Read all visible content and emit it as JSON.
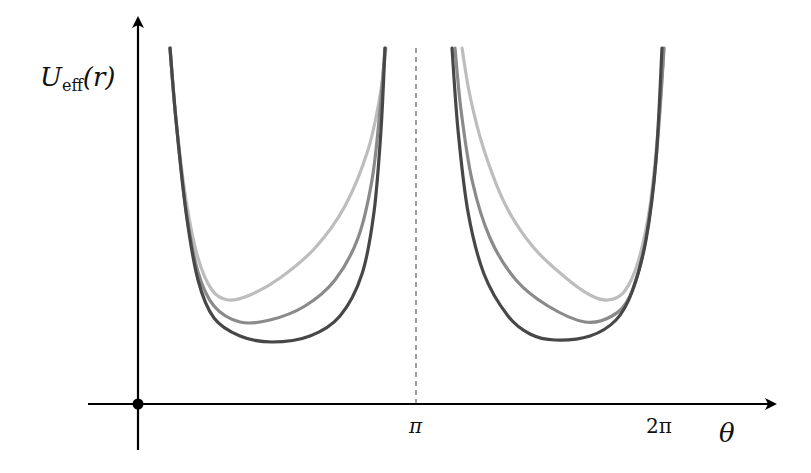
{
  "chart_data": {
    "type": "line",
    "title": "",
    "xlabel": "θ",
    "ylabel_main": "U",
    "ylabel_sub": "eff",
    "ylabel_arg": "(r)",
    "x_ticks": [
      {
        "label": "π",
        "value": 3.14159
      },
      {
        "label": "2π",
        "value": 6.28318
      }
    ],
    "xlim": [
      0,
      7.0
    ],
    "grid": false,
    "legend": null,
    "annotations": [
      "dashed vertical line at θ = π",
      "dot at origin"
    ],
    "series": [
      {
        "name": "curve-light",
        "color": "#bdbdbd",
        "branches": [
          {
            "points": [
              [
                170,
                48
              ],
              [
                176,
                120
              ],
              [
                186,
                200
              ],
              [
                198,
                258
              ],
              [
                212,
                290
              ],
              [
                228,
                300
              ],
              [
                250,
                295
              ],
              [
                280,
                278
              ],
              [
                315,
                248
              ],
              [
                345,
                206
              ],
              [
                368,
                150
              ],
              [
                380,
                96
              ],
              [
                386,
                48
              ]
            ]
          },
          {
            "points": [
              [
                462,
                48
              ],
              [
                470,
                96
              ],
              [
                484,
                150
              ],
              [
                506,
                206
              ],
              [
                534,
                248
              ],
              [
                566,
                278
              ],
              [
                590,
                295
              ],
              [
                608,
                300
              ],
              [
                624,
                292
              ],
              [
                638,
                262
              ],
              [
                650,
                206
              ],
              [
                658,
                130
              ],
              [
                664,
                48
              ]
            ]
          }
        ]
      },
      {
        "name": "curve-medium",
        "color": "#8a8a8a",
        "branches": [
          {
            "points": [
              [
                170,
                48
              ],
              [
                176,
                120
              ],
              [
                186,
                210
              ],
              [
                198,
                272
              ],
              [
                214,
                306
              ],
              [
                240,
                322
              ],
              [
                270,
                320
              ],
              [
                305,
                306
              ],
              [
                335,
                280
              ],
              [
                358,
                238
              ],
              [
                372,
                180
              ],
              [
                380,
                110
              ],
              [
                385,
                48
              ]
            ]
          },
          {
            "points": [
              [
                455,
                48
              ],
              [
                461,
                110
              ],
              [
                472,
                180
              ],
              [
                490,
                238
              ],
              [
                516,
                280
              ],
              [
                548,
                306
              ],
              [
                585,
                322
              ],
              [
                612,
                316
              ],
              [
                630,
                296
              ],
              [
                644,
                248
              ],
              [
                654,
                180
              ],
              [
                660,
                110
              ],
              [
                664,
                48
              ]
            ]
          }
        ]
      },
      {
        "name": "curve-dark",
        "color": "#474747",
        "branches": [
          {
            "points": [
              [
                170,
                48
              ],
              [
                176,
                120
              ],
              [
                186,
                212
              ],
              [
                198,
                280
              ],
              [
                214,
                318
              ],
              [
                240,
                336
              ],
              [
                272,
                342
              ],
              [
                310,
                336
              ],
              [
                340,
                316
              ],
              [
                362,
                274
              ],
              [
                374,
                212
              ],
              [
                381,
                130
              ],
              [
                385,
                48
              ]
            ]
          },
          {
            "points": [
              [
                452,
                48
              ],
              [
                458,
                130
              ],
              [
                468,
                212
              ],
              [
                484,
                274
              ],
              [
                508,
                316
              ],
              [
                530,
                334
              ],
              [
                555,
                340
              ],
              [
                590,
                336
              ],
              [
                616,
                320
              ],
              [
                632,
                292
              ],
              [
                646,
                240
              ],
              [
                656,
                160
              ],
              [
                662,
                48
              ]
            ]
          }
        ]
      }
    ]
  },
  "axes": {
    "origin": [
      138,
      404
    ],
    "x_axis": {
      "from": [
        88,
        404
      ],
      "to": [
        775,
        404
      ]
    },
    "y_axis": {
      "from": [
        138,
        450
      ],
      "to": [
        138,
        18
      ]
    },
    "pi_x": 416,
    "two_pi_x": 660,
    "dashed_line": {
      "x": 416,
      "y_top": 48,
      "y_bottom": 404,
      "color": "#888888"
    }
  },
  "labels": {
    "y_main": "U",
    "y_sub": "eff",
    "y_arg": "(r)",
    "tick_pi": "π",
    "tick_2pi": "2π",
    "x_label": "θ"
  }
}
